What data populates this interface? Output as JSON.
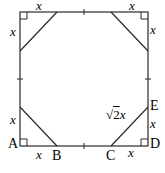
{
  "diagram": {
    "type": "geometry",
    "square": {
      "left": 20,
      "top": 12,
      "right": 148,
      "bottom": 146
    },
    "cut": 37,
    "points": {
      "A": "A",
      "B": "B",
      "C": "C",
      "D": "D",
      "E": "E"
    },
    "labels": {
      "x": "x",
      "hyp_radical": "√",
      "hyp_two": "2",
      "hyp_x": "x"
    },
    "line_color": "#2a2a2a"
  }
}
